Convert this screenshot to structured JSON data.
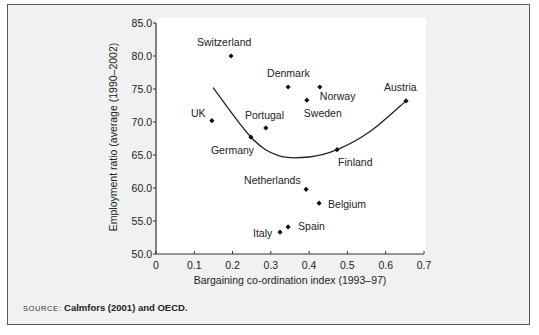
{
  "chart_data": {
    "type": "scatter",
    "title": "",
    "xlabel": "Bargaining co-ordination index (1993–97)",
    "ylabel": "Employment ratio (average (1990–2002)",
    "xlim": [
      0,
      0.7
    ],
    "ylim": [
      50.0,
      85.0
    ],
    "x_ticks": [
      "0",
      "0.1",
      "0.2",
      "0.3",
      "0.4",
      "0.5",
      "0.6",
      "0.7"
    ],
    "x_tick_values": [
      0,
      0.1,
      0.2,
      0.3,
      0.4,
      0.5,
      0.6,
      0.7
    ],
    "y_ticks": [
      "50.0",
      "55.0",
      "60.0",
      "65.0",
      "70.0",
      "75.0",
      "80.0",
      "85.0"
    ],
    "y_tick_values": [
      50,
      55,
      60,
      65,
      70,
      75,
      80,
      85
    ],
    "grid": false,
    "legend": null,
    "points": [
      {
        "label": "Switzerland",
        "x": 0.196,
        "y": 80.0,
        "label_dx": -34,
        "label_dy": -10
      },
      {
        "label": "UK",
        "x": 0.146,
        "y": 70.2,
        "label_dx": -21,
        "label_dy": -4
      },
      {
        "label": "Germany",
        "x": 0.248,
        "y": 67.7,
        "label_dx": -40,
        "label_dy": 17
      },
      {
        "label": "Portugal",
        "x": 0.287,
        "y": 69.1,
        "label_dx": -21,
        "label_dy": -9
      },
      {
        "label": "Denmark",
        "x": 0.345,
        "y": 75.3,
        "label_dx": -21,
        "label_dy": -10
      },
      {
        "label": "Norway",
        "x": 0.428,
        "y": 75.3,
        "label_dx": 0,
        "label_dy": 13
      },
      {
        "label": "Sweden",
        "x": 0.394,
        "y": 73.3,
        "label_dx": -3,
        "label_dy": 17
      },
      {
        "label": "Austria",
        "x": 0.653,
        "y": 73.2,
        "label_dx": -22,
        "label_dy": -10
      },
      {
        "label": "Finland",
        "x": 0.473,
        "y": 65.8,
        "label_dx": 1,
        "label_dy": 16
      },
      {
        "label": "Netherlands",
        "x": 0.392,
        "y": 59.8,
        "label_dx": -62,
        "label_dy": -5
      },
      {
        "label": "Belgium",
        "x": 0.426,
        "y": 57.7,
        "label_dx": 9,
        "label_dy": 5
      },
      {
        "label": "Italy",
        "x": 0.324,
        "y": 53.3,
        "label_dx": -27,
        "label_dy": 5
      },
      {
        "label": "Spain",
        "x": 0.345,
        "y": 54.1,
        "label_dx": 10,
        "label_dy": 3
      }
    ],
    "fit_curve": {
      "type": "quadratic",
      "points": [
        {
          "x": 0.149,
          "y": 75.2
        },
        {
          "x": 0.248,
          "y": 67.7
        },
        {
          "x": 0.32,
          "y": 64.9
        },
        {
          "x": 0.4,
          "y": 64.7
        },
        {
          "x": 0.473,
          "y": 65.8
        },
        {
          "x": 0.56,
          "y": 68.6
        },
        {
          "x": 0.653,
          "y": 73.2
        }
      ]
    }
  },
  "source": {
    "label": "SOURCE:",
    "text": "Calmfors (2001) and OECD."
  },
  "style": {
    "frame_background": "#f1f1f1",
    "plot_background": "#ffffff",
    "axis_color": "#333333",
    "marker_color": "#111111",
    "curve_color": "#222222",
    "text_color": "#222222"
  }
}
